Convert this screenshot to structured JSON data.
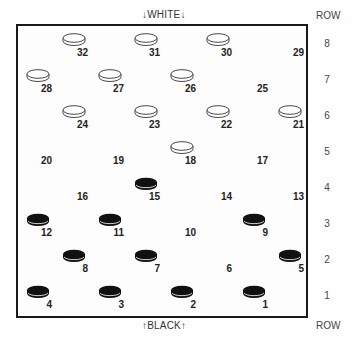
{
  "labels": {
    "top": "↓WHITE↓",
    "bottom": "↑BLACK↑",
    "row_header": "ROW"
  },
  "rows": [
    "8",
    "7",
    "6",
    "5",
    "4",
    "3",
    "2",
    "1"
  ],
  "colors": {
    "board_border": "#1a1a1a",
    "white_piece_fill": "#ffffff",
    "white_piece_stroke": "#333333",
    "black_piece_fill": "#111111",
    "black_piece_highlight": "#ffffff"
  },
  "squares": [
    {
      "num": "32",
      "row": 8,
      "col": 1,
      "piece": "white"
    },
    {
      "num": "31",
      "row": 8,
      "col": 3,
      "piece": "white"
    },
    {
      "num": "30",
      "row": 8,
      "col": 5,
      "piece": "white"
    },
    {
      "num": "29",
      "row": 8,
      "col": 7,
      "piece": null
    },
    {
      "num": "28",
      "row": 7,
      "col": 0,
      "piece": "white"
    },
    {
      "num": "27",
      "row": 7,
      "col": 2,
      "piece": "white"
    },
    {
      "num": "26",
      "row": 7,
      "col": 4,
      "piece": "white"
    },
    {
      "num": "25",
      "row": 7,
      "col": 6,
      "piece": null
    },
    {
      "num": "24",
      "row": 6,
      "col": 1,
      "piece": "white"
    },
    {
      "num": "23",
      "row": 6,
      "col": 3,
      "piece": "white"
    },
    {
      "num": "22",
      "row": 6,
      "col": 5,
      "piece": "white"
    },
    {
      "num": "21",
      "row": 6,
      "col": 7,
      "piece": "white"
    },
    {
      "num": "20",
      "row": 5,
      "col": 0,
      "piece": null
    },
    {
      "num": "19",
      "row": 5,
      "col": 2,
      "piece": null
    },
    {
      "num": "18",
      "row": 5,
      "col": 4,
      "piece": "white"
    },
    {
      "num": "17",
      "row": 5,
      "col": 6,
      "piece": null
    },
    {
      "num": "16",
      "row": 4,
      "col": 1,
      "piece": null
    },
    {
      "num": "15",
      "row": 4,
      "col": 3,
      "piece": "black"
    },
    {
      "num": "14",
      "row": 4,
      "col": 5,
      "piece": null
    },
    {
      "num": "13",
      "row": 4,
      "col": 7,
      "piece": null
    },
    {
      "num": "12",
      "row": 3,
      "col": 0,
      "piece": "black"
    },
    {
      "num": "11",
      "row": 3,
      "col": 2,
      "piece": "black"
    },
    {
      "num": "10",
      "row": 3,
      "col": 4,
      "piece": null
    },
    {
      "num": "9",
      "row": 3,
      "col": 6,
      "piece": "black"
    },
    {
      "num": "8",
      "row": 2,
      "col": 1,
      "piece": "black"
    },
    {
      "num": "7",
      "row": 2,
      "col": 3,
      "piece": "black"
    },
    {
      "num": "6",
      "row": 2,
      "col": 5,
      "piece": null
    },
    {
      "num": "5",
      "row": 2,
      "col": 7,
      "piece": "black"
    },
    {
      "num": "4",
      "row": 1,
      "col": 0,
      "piece": "black"
    },
    {
      "num": "3",
      "row": 1,
      "col": 2,
      "piece": "black"
    },
    {
      "num": "2",
      "row": 1,
      "col": 4,
      "piece": "black"
    },
    {
      "num": "1",
      "row": 1,
      "col": 6,
      "piece": "black"
    }
  ]
}
